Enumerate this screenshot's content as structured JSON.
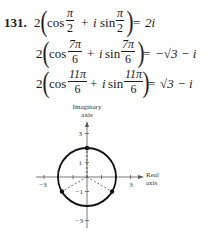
{
  "exercise": {
    "number": "131.",
    "lines": [
      {
        "coef": "2",
        "func1": "cos",
        "frac1": {
          "num": "π",
          "den": "2"
        },
        "plus": "+",
        "imag": "i",
        "func2": "sin",
        "frac2": {
          "num": "π",
          "den": "2"
        },
        "eq": "=",
        "result": "2i"
      },
      {
        "coef": "2",
        "func1": "cos",
        "frac1": {
          "num": "7π",
          "den": "6"
        },
        "plus": "+",
        "imag": "i",
        "func2": "sin",
        "frac2": {
          "num": "7π",
          "den": "6"
        },
        "eq": "=",
        "result": "−√3 − i"
      },
      {
        "coef": "2",
        "func1": "cos",
        "frac1": {
          "num": "11π",
          "den": "6"
        },
        "plus": "+",
        "imag": "i",
        "func2": "sin",
        "frac2": {
          "num": "11π",
          "den": "6"
        },
        "eq": "=",
        "result": "√3 − i"
      }
    ]
  },
  "graph": {
    "y_axis_label_1": "Imaginary",
    "y_axis_label_2": "axis",
    "x_axis_label_1": "Real",
    "x_axis_label_2": "axis",
    "x_ticks": {
      "neg3": "−3",
      "pos3": "3"
    },
    "y_ticks": {
      "pos3": "3",
      "pos1": "1",
      "neg1": "−1",
      "neg3": "−3"
    },
    "circle_radius": 2,
    "points": [
      {
        "label": "2i",
        "x": 0,
        "y": 2
      },
      {
        "label": "−√3 − i",
        "x": -1.732,
        "y": -1
      },
      {
        "label": "√3 − i",
        "x": 1.732,
        "y": -1
      }
    ]
  }
}
